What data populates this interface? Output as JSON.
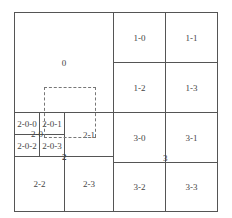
{
  "diagram": {
    "type": "quadtree-tiles",
    "cells": [
      {
        "id": "0",
        "label": "0"
      },
      {
        "id": "1-0",
        "label": "1-0"
      },
      {
        "id": "1-1",
        "label": "1-1"
      },
      {
        "id": "1-2",
        "label": "1-2"
      },
      {
        "id": "1-3",
        "label": "1-3"
      },
      {
        "id": "2-0",
        "label": "2-0"
      },
      {
        "id": "2-0-0",
        "label": "2-0-0"
      },
      {
        "id": "2-0-1",
        "label": "2-0-1"
      },
      {
        "id": "2-0-2",
        "label": "2-0-2"
      },
      {
        "id": "2-0-3",
        "label": "2-0-3"
      },
      {
        "id": "2-1",
        "label": "2-1"
      },
      {
        "id": "2-2",
        "label": "2-2"
      },
      {
        "id": "2-3",
        "label": "2-3"
      },
      {
        "id": "3-0",
        "label": "3-0"
      },
      {
        "id": "3-1",
        "label": "3-1"
      },
      {
        "id": "3-2",
        "label": "3-2"
      },
      {
        "id": "3-3",
        "label": "3-3"
      }
    ],
    "node_labels": {
      "q2": "2",
      "q3": "3"
    },
    "viewport": {
      "style": "dashed"
    }
  }
}
